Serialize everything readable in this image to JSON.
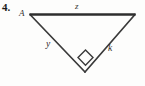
{
  "figure": {
    "exercise_number": "4.",
    "kind": "right-triangle-diagram",
    "background_color": "#fdfdfc",
    "stroke_color": "#3a3a3a",
    "top_edge_color": "#2e2e2e",
    "labels": {
      "vertex_a": "A",
      "side_top": "z",
      "side_left": "y",
      "side_right": "k"
    },
    "right_angle": {
      "at_vertex": "bottom",
      "marker": "square"
    },
    "geometry": {
      "vertex_left": {
        "x": 30,
        "y": 14
      },
      "vertex_right": {
        "x": 135,
        "y": 14
      },
      "vertex_bottom": {
        "x": 85,
        "y": 72
      }
    }
  }
}
